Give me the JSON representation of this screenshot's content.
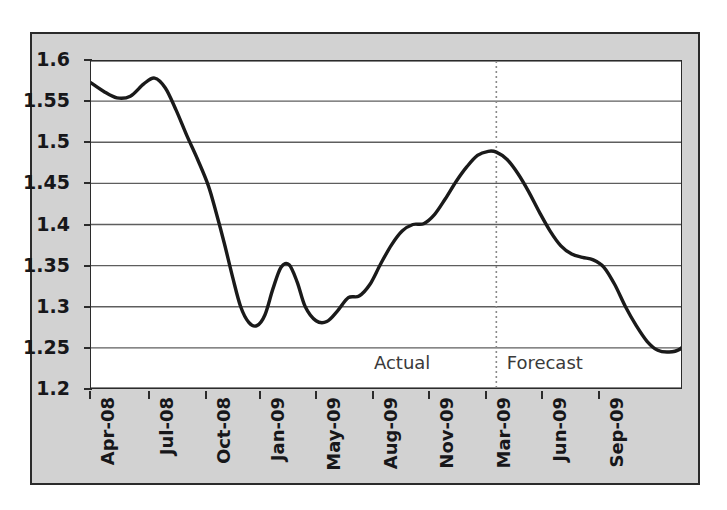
{
  "chart_data": {
    "type": "line",
    "title": "",
    "subtitle": "",
    "xlabel": "",
    "ylabel": "",
    "ylim": [
      1.2,
      1.6
    ],
    "xlim": [
      0,
      22
    ],
    "grid": true,
    "grid_axis": "y",
    "legend": "none",
    "line_color": "#1a1a1a",
    "plot_bg": "#ffffff",
    "figure_bg": "#d2d2d2",
    "axis_color": "#2b2b2b",
    "yticks": [
      "1.6",
      "1.55",
      "1.5",
      "1.45",
      "1.4",
      "1.35",
      "1.3",
      "1.25",
      "1.2"
    ],
    "ytick_values": [
      1.6,
      1.55,
      1.5,
      1.45,
      1.4,
      1.35,
      1.3,
      1.25,
      1.2
    ],
    "xticks": [
      "Apr-08",
      "Jul-08",
      "Oct-08",
      "Jan-09",
      "May-09",
      "Aug-09",
      "Nov-09",
      "Mar-09",
      "Jun-09",
      "Sep-09"
    ],
    "xtick_positions": [
      0,
      2.2,
      4.3,
      6.3,
      8.4,
      10.5,
      12.6,
      14.7,
      16.8,
      18.9
    ],
    "annotations": [
      {
        "text": "Actual",
        "x": 11.6,
        "y": 1.232,
        "name": "actual-label"
      },
      {
        "text": "Forecast",
        "x": 16.9,
        "y": 1.232,
        "name": "forecast-label"
      }
    ],
    "divider": {
      "x": 15.1,
      "style": "dotted",
      "color": "#8a8a8a"
    },
    "x": [
      0.0,
      0.5,
      1.0,
      1.5,
      2.0,
      2.4,
      2.8,
      3.2,
      3.6,
      4.0,
      4.4,
      4.7,
      5.0,
      5.3,
      5.6,
      5.9,
      6.2,
      6.5,
      6.8,
      7.1,
      7.4,
      7.7,
      8.0,
      8.4,
      8.8,
      9.2,
      9.6,
      10.0,
      10.4,
      10.8,
      11.2,
      11.6,
      12.0,
      12.4,
      12.8,
      13.2,
      13.6,
      14.0,
      14.4,
      14.8,
      15.1,
      15.5,
      15.9,
      16.3,
      16.7,
      17.1,
      17.5,
      17.9,
      18.3,
      18.7,
      19.1,
      19.5,
      19.9,
      20.3,
      20.7,
      21.1
    ],
    "y": [
      1.573,
      1.562,
      1.554,
      1.556,
      1.571,
      1.578,
      1.566,
      1.539,
      1.508,
      1.479,
      1.447,
      1.413,
      1.376,
      1.336,
      1.3,
      1.281,
      1.277,
      1.29,
      1.322,
      1.348,
      1.351,
      1.33,
      1.3,
      1.283,
      1.282,
      1.295,
      1.311,
      1.313,
      1.327,
      1.352,
      1.375,
      1.392,
      1.4,
      1.401,
      1.412,
      1.431,
      1.452,
      1.47,
      1.484,
      1.489,
      1.488,
      1.479,
      1.462,
      1.44,
      1.415,
      1.392,
      1.374,
      1.364,
      1.36,
      1.357,
      1.348,
      1.327,
      1.3,
      1.277,
      1.258,
      1.247
    ],
    "y_forecast_tail": [
      1.245,
      1.248,
      1.262,
      1.288,
      1.32,
      1.356,
      1.392,
      1.424,
      1.449,
      1.462,
      1.468,
      1.47
    ],
    "series_note": "Single continuous line; segment left of divider is Actual, right of divider is Forecast"
  }
}
